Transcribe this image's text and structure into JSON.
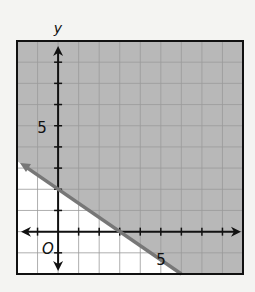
{
  "chart_data": {
    "type": "line",
    "title": "",
    "xlabel": "",
    "ylabel": "y",
    "origin_label": "O",
    "xlim": [
      -2,
      9
    ],
    "ylim": [
      -2,
      9
    ],
    "grid": true,
    "tick_labels": {
      "x": [
        {
          "value": 5,
          "label": "5"
        }
      ],
      "y": [
        {
          "value": 5,
          "label": "5"
        }
      ]
    },
    "boundary_line": {
      "equation": "y = -2/3 x + 2",
      "slope": -0.6667,
      "intercept": 2,
      "style": "solid",
      "points": [
        [
          -2,
          3.333
        ],
        [
          0,
          2
        ],
        [
          3,
          0
        ],
        [
          6,
          -2
        ]
      ]
    },
    "shaded_region": "above",
    "inequality": "y >= -2/3 x + 2",
    "colors": {
      "shade": "#b8b8b8",
      "grid": "#9a9a9a",
      "line": "#777777",
      "axis": "#111111",
      "background": "#ffffff"
    }
  }
}
